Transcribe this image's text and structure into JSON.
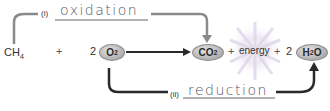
{
  "equation": {
    "reactant1": "CH4",
    "reactant1_main": "CH",
    "reactant1_sub": "4",
    "plus1": "+",
    "coef_o2": "2",
    "o2_main": "O",
    "o2_sub": "2",
    "co2_main": "CO",
    "co2_sub": "2",
    "plus2": "+",
    "energy": "energy",
    "plus3": "+",
    "coef_h2o": "2",
    "h2o_h": "H",
    "h2o_sub": "2",
    "h2o_o": "O"
  },
  "labels": {
    "oxidation_num": "(i)",
    "oxidation": "oxidation",
    "reduction_num": "(ii)",
    "reduction": "reduction"
  },
  "colors": {
    "oxidation_arrow": "#8a8a8a",
    "reduction_arrow": "#2a2a2a",
    "pill_fill": "#bdbdbd",
    "energy_glow": "#e6e0f0"
  }
}
